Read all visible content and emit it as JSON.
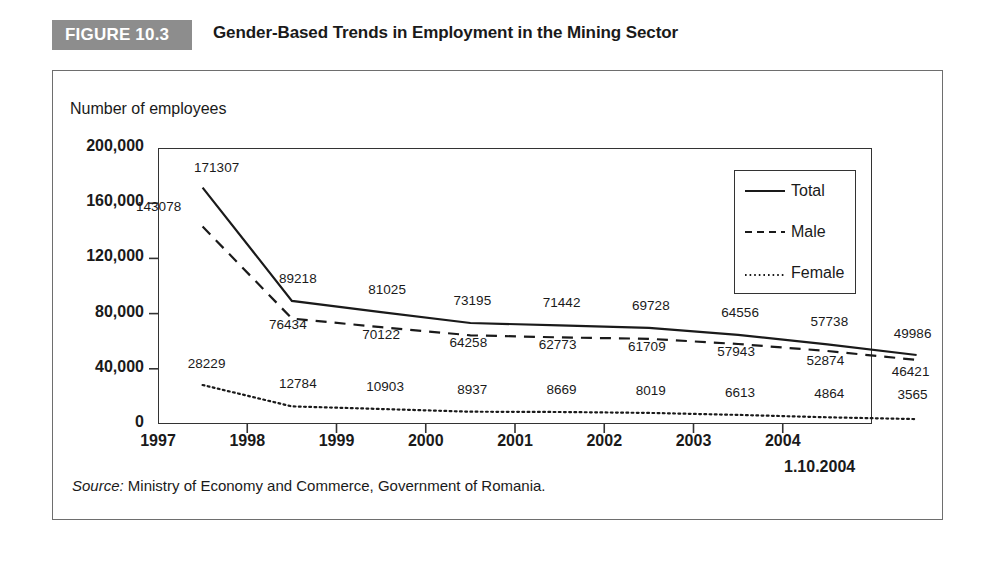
{
  "figure": {
    "badge": "FIGURE 10.3",
    "title": "Gender-Based Trends in Employment in the Mining Sector",
    "source_label": "Source:",
    "source_text": " Ministry of Economy and Commerce, Government of Romania.",
    "badge_color": "#8d8d8d",
    "border_color": "#6e6e6e",
    "ink_color": "#1a1a1a"
  },
  "chart_data": {
    "type": "line",
    "title": "Gender-Based Trends in Employment in the Mining Sector",
    "xlabel": "",
    "ylabel": "Number of employees",
    "ylim": [
      0,
      200000
    ],
    "ytick_labels": [
      "200,000",
      "160,000",
      "120,000",
      "80,000",
      "40,000",
      "0"
    ],
    "ytick_values": [
      200000,
      160000,
      120000,
      80000,
      40000,
      0
    ],
    "xtick_labels": [
      "1997",
      "1998",
      "1999",
      "2000",
      "2001",
      "2002",
      "2003",
      "2004"
    ],
    "x_end_label": "1.10.2004",
    "categories": [
      "1997",
      "1998",
      "1999",
      "2000",
      "2001",
      "2002",
      "2003",
      "2004",
      "1.10.2004"
    ],
    "grid": false,
    "legend_position": "upper-right",
    "series": [
      {
        "name": "Total",
        "style": "solid",
        "values": [
          171307,
          89218,
          81025,
          73195,
          71442,
          69728,
          64556,
          57738,
          49986
        ],
        "labels": [
          "171307",
          "89218",
          "81025",
          "73195",
          "71442",
          "69728",
          "64556",
          "57738",
          "49986"
        ]
      },
      {
        "name": "Male",
        "style": "dashed",
        "values": [
          143078,
          76434,
          70122,
          64258,
          62773,
          61709,
          57943,
          52874,
          46421
        ],
        "labels": [
          "143078",
          "76434",
          "70122",
          "64258",
          "62773",
          "61709",
          "57943",
          "52874",
          "46421"
        ]
      },
      {
        "name": "Female",
        "style": "dotted",
        "values": [
          28229,
          12784,
          10903,
          8937,
          8669,
          8019,
          6613,
          4864,
          3565
        ],
        "labels": [
          "28229",
          "12784",
          "10903",
          "8937",
          "8669",
          "8019",
          "6613",
          "4864",
          "3565"
        ]
      }
    ]
  },
  "legend": {
    "items": [
      {
        "label": "Total"
      },
      {
        "label": "Male"
      },
      {
        "label": "Female"
      }
    ]
  }
}
